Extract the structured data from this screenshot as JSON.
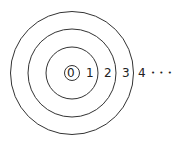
{
  "diagram": {
    "center": [
      72,
      73
    ],
    "circles": [
      {
        "r": 7.5
      },
      {
        "r": 26
      },
      {
        "r": 44
      },
      {
        "r": 61.5
      }
    ],
    "labels": [
      {
        "text": "0",
        "x": 67,
        "y": 67
      },
      {
        "text": "1",
        "x": 86,
        "y": 67
      },
      {
        "text": "2",
        "x": 104,
        "y": 67
      },
      {
        "text": "3",
        "x": 122,
        "y": 67
      },
      {
        "text": "4",
        "x": 137,
        "y": 67
      }
    ],
    "ellipsis": "• • •",
    "stroke": "#333333"
  }
}
